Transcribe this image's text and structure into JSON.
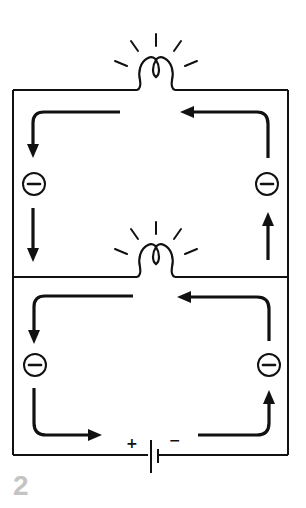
{
  "figure": {
    "number": "2"
  },
  "battery": {
    "positive_label": "+",
    "negative_label": "−"
  },
  "electron_symbol": "⊖",
  "colors": {
    "line": "#111111",
    "figure_number": "#c4c4c4",
    "background": "#ffffff"
  }
}
